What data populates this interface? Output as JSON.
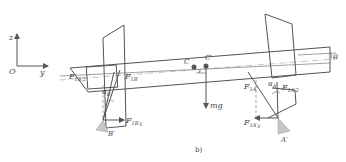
{
  "figure": {
    "caption": "b)",
    "axes": {
      "origin": "O",
      "vertical": "z",
      "horizontal": "y"
    },
    "labels": {
      "angle_tilt": "θ",
      "center_c": "C",
      "center_c_prime": "C′",
      "offset": "y",
      "weight": "mg",
      "support_left": "B′",
      "support_right": "A′",
      "alpha_left": {
        "main": "α",
        "sub": "B′"
      },
      "alpha_right": {
        "main": "α",
        "sub": "A′"
      },
      "f_b2": {
        "main": "F",
        "sub": "1B′2"
      },
      "f_b1": {
        "main": "F",
        "sub": "1B′"
      },
      "f_by": {
        "main": "F",
        "sub": "1B′y"
      },
      "f_a1": {
        "main": "F",
        "sub": "1A′"
      },
      "f_a2": {
        "main": "F",
        "sub": "1A′2"
      },
      "f_ay": {
        "main": "F",
        "sub": "1A′y"
      }
    },
    "colors": {
      "line": "#555555",
      "support_fill": "#c8c8c8",
      "text": "#444444"
    }
  }
}
